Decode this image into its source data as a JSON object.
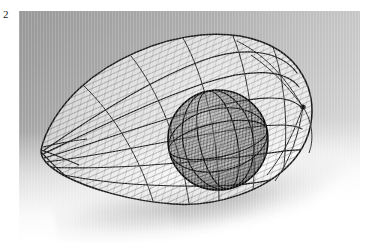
{
  "figure": {
    "label": "2"
  },
  "photo": {
    "subject_name": "wire-mesh-sculpture",
    "description": "Teardrop / egg shaped openwork wire sculpture containing a dense inner sphere, photographed on a graduated grey-to-white studio backdrop with a soft cast shadow.",
    "alt_text": "Wire mesh teardrop sculpture with inner sphere",
    "background_top_left_color": "#c0c0c0",
    "background_bottom_right_color": "#ffffff",
    "wire_color": "#2b2b2b",
    "shadow_color": "#8c8c8c",
    "inner_sphere_color": "#1e1e1e"
  },
  "parts": [
    {
      "name": "outer-shell",
      "label": "Outer woven teardrop shell"
    },
    {
      "name": "inner-sphere",
      "label": "Dense inner sphere"
    },
    {
      "name": "pointed-tip",
      "label": "Pointed left tip"
    },
    {
      "name": "rib-lines",
      "label": "Longitudinal rib wires"
    },
    {
      "name": "cast-shadow",
      "label": "Cast shadow"
    }
  ]
}
